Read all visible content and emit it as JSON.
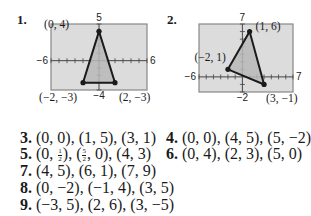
{
  "graphs": [
    {
      "label": "1.",
      "xmin": -6,
      "xmax": 6,
      "ymin": -4,
      "ymax": 5,
      "axis_labels": {
        "left": "−6",
        "right": "6",
        "top": "5",
        "bottom": "−4"
      },
      "vertices": [
        {
          "x": 0,
          "y": 4,
          "label": "(0, 4)"
        },
        {
          "x": -2,
          "y": -3,
          "label": "(−2, −3)"
        },
        {
          "x": 2,
          "y": -3,
          "label": "(2, −3)"
        }
      ]
    },
    {
      "label": "2.",
      "xmin": -6,
      "xmax": 7,
      "ymin": -2,
      "ymax": 7,
      "axis_labels": {
        "left": "−6",
        "right": "7",
        "top": "7",
        "bottom": "−2"
      },
      "vertices": [
        {
          "x": 1,
          "y": 6,
          "label": "(1, 6)"
        },
        {
          "x": -2,
          "y": 1,
          "label": "(−2, 1)"
        },
        {
          "x": 3,
          "y": -1,
          "label": "(3, −1)"
        }
      ]
    }
  ],
  "colors": {
    "screen_bg": "#dcdcdc",
    "fill": "#b8b8b8",
    "line": "#1a1a1a",
    "frame": "#888888"
  },
  "answers": [
    {
      "num": "3.",
      "text": "(0, 0), (1, 5), (3, 1)"
    },
    {
      "num": "4.",
      "text": "(0, 0), (4, 5), (5, −2)"
    },
    {
      "num": "5.",
      "parts": [
        "(0, ",
        {
          "n": "1",
          "d": "2"
        },
        "), (",
        {
          "n": "5",
          "d": "2"
        },
        ", 0), (4, 3)"
      ]
    },
    {
      "num": "6.",
      "text": "(0, 4), (2, 3), (5, 0)"
    },
    {
      "num": "7.",
      "text": "(4, 5), (6, 1), (7, 9)"
    },
    {
      "num": "8.",
      "text": "(0, −2), (−1, 4), (3, 5)"
    },
    {
      "num": "9.",
      "text": "(−3, 5), (2, 6), (3, −5)"
    }
  ]
}
